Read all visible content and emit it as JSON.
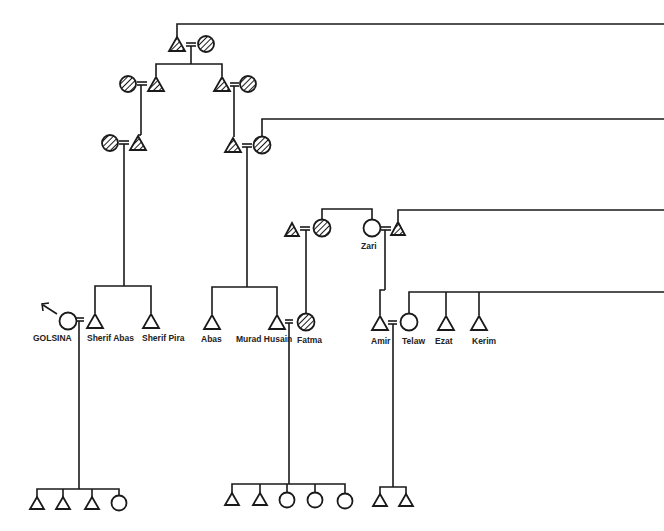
{
  "diagram": {
    "type": "kinship-genealogy",
    "colors": {
      "ink": "#1a1a1a",
      "background": "#ffffff"
    },
    "legend_implicit": {
      "triangle": "male",
      "circle": "female",
      "hatched": "deceased / earlier generation",
      "double_line": "marriage"
    },
    "labels": {
      "golsina": "GOLSINA",
      "sherif_abas": "Sherif Abas",
      "sherif_pira": "Sherif Pira",
      "abas": "Abas",
      "murad_husain": "Murad Husain",
      "fatma": "Fatma",
      "zari": "Zari",
      "amir": "Amir",
      "telaw": "Telaw",
      "ezat": "Ezat",
      "kerim": "Kerim"
    },
    "nodes": [
      {
        "id": "g1m",
        "shape": "triangle",
        "hatched": true,
        "x": 177,
        "y": 45
      },
      {
        "id": "g1f",
        "shape": "circle",
        "hatched": true,
        "x": 206,
        "y": 44
      },
      {
        "id": "g2lf",
        "shape": "circle",
        "hatched": true,
        "x": 128,
        "y": 84
      },
      {
        "id": "g2lm",
        "shape": "triangle",
        "hatched": true,
        "x": 156,
        "y": 84
      },
      {
        "id": "g2rm",
        "shape": "triangle",
        "hatched": true,
        "x": 222,
        "y": 84
      },
      {
        "id": "g2rf",
        "shape": "circle",
        "hatched": true,
        "x": 248,
        "y": 84
      },
      {
        "id": "g3lf",
        "shape": "circle",
        "hatched": true,
        "x": 110,
        "y": 143
      },
      {
        "id": "g3lm",
        "shape": "triangle",
        "hatched": true,
        "x": 138,
        "y": 143
      },
      {
        "id": "g3rm",
        "shape": "triangle",
        "hatched": true,
        "x": 233,
        "y": 145
      },
      {
        "id": "g3rf",
        "shape": "circle",
        "hatched": true,
        "x": 262,
        "y": 145
      },
      {
        "id": "fm",
        "shape": "triangle",
        "hatched": true,
        "x": 292,
        "y": 229
      },
      {
        "id": "ff",
        "shape": "circle",
        "hatched": true,
        "x": 322,
        "y": 228
      },
      {
        "id": "zari",
        "shape": "circle",
        "hatched": false,
        "x": 372,
        "y": 228,
        "label": "Zari"
      },
      {
        "id": "zh",
        "shape": "triangle",
        "hatched": true,
        "x": 398,
        "y": 229
      },
      {
        "id": "golsina",
        "shape": "circle",
        "hatched": false,
        "x": 68,
        "y": 321,
        "label": "GOLSINA"
      },
      {
        "id": "sherif_abas",
        "shape": "triangle",
        "hatched": false,
        "x": 95,
        "y": 321,
        "label": "Sherif Abas"
      },
      {
        "id": "sherif_pira",
        "shape": "triangle",
        "hatched": false,
        "x": 151,
        "y": 321,
        "label": "Sherif Pira"
      },
      {
        "id": "abas",
        "shape": "triangle",
        "hatched": false,
        "x": 212,
        "y": 322,
        "label": "Abas"
      },
      {
        "id": "murad",
        "shape": "triangle",
        "hatched": false,
        "x": 277,
        "y": 322,
        "label": "Murad Husain"
      },
      {
        "id": "fatma",
        "shape": "circle",
        "hatched": true,
        "x": 306,
        "y": 322,
        "label": "Fatma"
      },
      {
        "id": "amir",
        "shape": "triangle",
        "hatched": false,
        "x": 380,
        "y": 323,
        "label": "Amir"
      },
      {
        "id": "telaw",
        "shape": "circle",
        "hatched": false,
        "x": 409,
        "y": 322,
        "label": "Telaw"
      },
      {
        "id": "ezat",
        "shape": "triangle",
        "hatched": false,
        "x": 446,
        "y": 323,
        "label": "Ezat"
      },
      {
        "id": "kerim",
        "shape": "triangle",
        "hatched": false,
        "x": 479,
        "y": 323,
        "label": "Kerim"
      }
    ],
    "children_groups": [
      {
        "parents": "golsina+sherif_abas",
        "children": [
          "m",
          "m",
          "m",
          "f"
        ]
      },
      {
        "parents": "murad+fatma",
        "children": [
          "m",
          "m",
          "f",
          "f",
          "f"
        ]
      },
      {
        "parents": "amir+telaw",
        "children": [
          "m",
          "m"
        ]
      }
    ]
  }
}
